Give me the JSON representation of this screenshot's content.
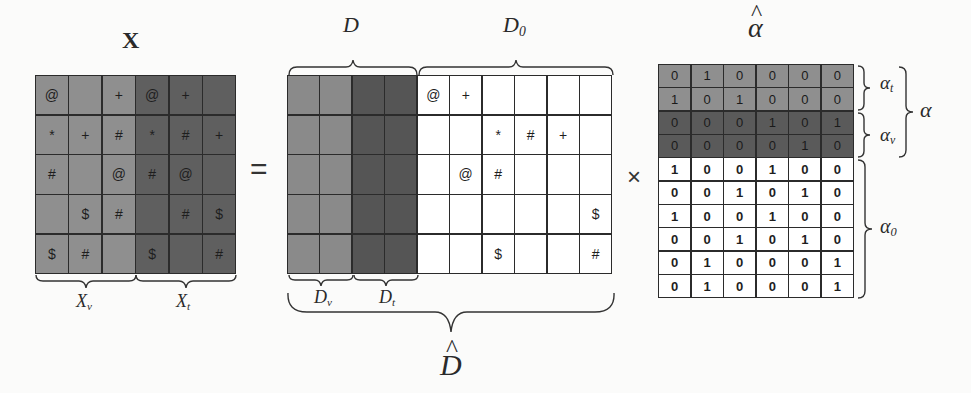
{
  "colors": {
    "background": "#fbfbfa",
    "x_light": "#8f8f8f",
    "x_dark": "#5f5f5f",
    "d_v": "#8a8a8a",
    "d_t": "#555555",
    "d0": "#ffffff",
    "alpha_t": "#8f8f8f",
    "alpha_v": "#5a5a5a",
    "alpha_0": "#ffffff",
    "grid_line": "#2b2b2b"
  },
  "labels": {
    "x_title": "X",
    "x_v": "X",
    "x_v_sub": "v",
    "x_t": "X",
    "x_t_sub": "t",
    "d": "D",
    "d0": "D",
    "d0_sub": "0",
    "d_v": "D",
    "d_v_sub": "v",
    "d_t": "D",
    "d_t_sub": "t",
    "d_hat": "D",
    "alpha_hat": "α",
    "alpha_t": "α",
    "alpha_t_sub": "t",
    "alpha_v": "α",
    "alpha_v_sub": "v",
    "alpha": "α",
    "alpha_0": "α",
    "alpha_0_sub": "0",
    "equals": "=",
    "times": "×"
  },
  "matrices": {
    "X": {
      "rows": 5,
      "cols": 6,
      "split_col": 3,
      "cells": [
        [
          "@",
          "",
          "+",
          "@",
          "+",
          ""
        ],
        [
          "*",
          "+",
          "#",
          "*",
          "#",
          "+"
        ],
        [
          "#",
          "",
          "@",
          "#",
          "@",
          ""
        ],
        [
          "",
          "$",
          "#",
          "",
          "#",
          "$"
        ],
        [
          "$",
          "#",
          "",
          "$",
          "",
          "#"
        ]
      ]
    },
    "D_hat": {
      "rows": 5,
      "cols": 10,
      "d_v_cols": 2,
      "d_t_cols": 2,
      "d0_cols": 6,
      "cells": [
        [
          "",
          "",
          "",
          "",
          "@",
          "+",
          "",
          "",
          "",
          ""
        ],
        [
          "",
          "",
          "",
          "",
          "",
          "",
          "*",
          "#",
          "+",
          ""
        ],
        [
          "",
          "",
          "",
          "",
          "",
          "@",
          "#",
          "",
          "",
          ""
        ],
        [
          "",
          "",
          "",
          "",
          "",
          "",
          "",
          "",
          "",
          "$"
        ],
        [
          "",
          "",
          "",
          "",
          "",
          "",
          "$",
          "",
          "",
          "#"
        ]
      ]
    },
    "alpha_hat": {
      "rows": 10,
      "cols": 6,
      "alpha_t_rows": 2,
      "alpha_v_rows": 2,
      "alpha_0_rows": 6,
      "cells": [
        [
          "0",
          "1",
          "0",
          "0",
          "0",
          "0"
        ],
        [
          "1",
          "0",
          "1",
          "0",
          "0",
          "0"
        ],
        [
          "0",
          "0",
          "0",
          "1",
          "0",
          "1"
        ],
        [
          "0",
          "0",
          "0",
          "0",
          "1",
          "0"
        ],
        [
          "1",
          "0",
          "0",
          "1",
          "0",
          "0"
        ],
        [
          "0",
          "0",
          "1",
          "0",
          "1",
          "0"
        ],
        [
          "1",
          "0",
          "0",
          "1",
          "0",
          "0"
        ],
        [
          "0",
          "0",
          "1",
          "0",
          "1",
          "0"
        ],
        [
          "0",
          "1",
          "0",
          "0",
          "0",
          "1"
        ],
        [
          "0",
          "1",
          "0",
          "0",
          "0",
          "1"
        ]
      ]
    }
  }
}
